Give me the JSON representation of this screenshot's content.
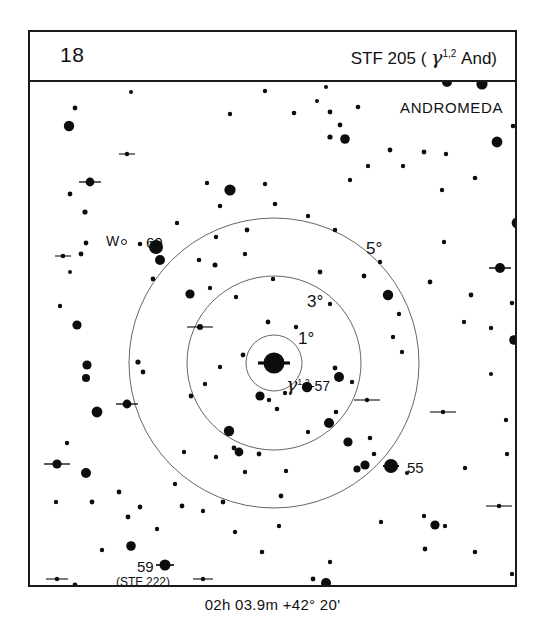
{
  "header": {
    "chart_number": "18",
    "title_prefix": "STF 205 ( ",
    "title_greek": "γ",
    "title_superscript": "1,2",
    "title_suffix": " And)"
  },
  "footer": {
    "coordinates": "02h 03.9m  +42° 20'"
  },
  "chart_data": {
    "type": "scatter",
    "title": "STF 205 ( γ1,2 And)",
    "chart_number": "18",
    "constellation": "ANDROMEDA",
    "center_coordinates": "02h 03.9m  +42° 20'",
    "direction_marker": "W",
    "field_center": {
      "x": 244,
      "y": 281
    },
    "rings": [
      {
        "label": "1°",
        "radius_px": 28,
        "degrees": 1
      },
      {
        "label": "3°",
        "radius_px": 87,
        "degrees": 3
      },
      {
        "label": "5°",
        "radius_px": 145,
        "degrees": 5
      }
    ],
    "star_labels": [
      {
        "text": "60",
        "star": "60 And"
      },
      {
        "text": "55",
        "star": "55 And"
      },
      {
        "text": "59",
        "star": "59 And"
      },
      {
        "text": "(STF 222)",
        "star": "59 And companion designation"
      },
      {
        "text": "γ1,2",
        "star": "gamma Andromedae (primary target)"
      },
      {
        "text": "-57",
        "star": "57 And"
      }
    ],
    "xlabel": "",
    "ylabel": "",
    "grid": false,
    "legend": "none",
    "stars": [
      {
        "x": 244,
        "y": 281,
        "r": 10.5,
        "tick": 16
      },
      {
        "x": 126,
        "y": 165,
        "r": 7.0,
        "tick": 0
      },
      {
        "x": 361,
        "y": 384,
        "r": 7.0,
        "tick": 8
      },
      {
        "x": 135,
        "y": 483,
        "r": 5.5,
        "tick": 9
      },
      {
        "x": 101,
        "y": 10,
        "r": 2.0,
        "tick": 0
      },
      {
        "x": 45,
        "y": 26,
        "r": 2.4,
        "tick": 0
      },
      {
        "x": 39,
        "y": 44,
        "r": 5.2,
        "tick": 0
      },
      {
        "x": 235,
        "y": 9,
        "r": 2.2,
        "tick": 0
      },
      {
        "x": 200,
        "y": 32,
        "r": 2.2,
        "tick": 0
      },
      {
        "x": 264,
        "y": 31,
        "r": 2.3,
        "tick": 0
      },
      {
        "x": 300,
        "y": 30,
        "r": 2.4,
        "tick": 0
      },
      {
        "x": 296,
        "y": 5,
        "r": 2.0,
        "tick": 0
      },
      {
        "x": 417,
        "y": 0,
        "r": 5.0,
        "tick": 0
      },
      {
        "x": 452,
        "y": 2,
        "r": 5.6,
        "tick": 0
      },
      {
        "x": 483,
        "y": 44,
        "r": 2.3,
        "tick": 0
      },
      {
        "x": 467,
        "y": 60,
        "r": 5.4,
        "tick": 0
      },
      {
        "x": 310,
        "y": 43,
        "r": 2.4,
        "tick": 0
      },
      {
        "x": 328,
        "y": 25,
        "r": 2.3,
        "tick": 0
      },
      {
        "x": 300,
        "y": 55,
        "r": 2.6,
        "tick": 0
      },
      {
        "x": 315,
        "y": 57,
        "r": 4.8,
        "tick": 0
      },
      {
        "x": 287,
        "y": 19,
        "r": 2.0,
        "tick": 0
      },
      {
        "x": 360,
        "y": 68,
        "r": 2.4,
        "tick": 0
      },
      {
        "x": 394,
        "y": 70,
        "r": 2.4,
        "tick": 0
      },
      {
        "x": 373,
        "y": 84,
        "r": 2.2,
        "tick": 0
      },
      {
        "x": 338,
        "y": 84,
        "r": 2.2,
        "tick": 0
      },
      {
        "x": 320,
        "y": 98,
        "r": 2.2,
        "tick": 0
      },
      {
        "x": 490,
        "y": 78,
        "r": 2.0,
        "tick": 0
      },
      {
        "x": 97,
        "y": 72,
        "r": 2.2,
        "tick": 8
      },
      {
        "x": 60,
        "y": 100,
        "r": 4.4,
        "tick": 11
      },
      {
        "x": 40,
        "y": 112,
        "r": 2.4,
        "tick": 0
      },
      {
        "x": 55,
        "y": 130,
        "r": 2.6,
        "tick": 0
      },
      {
        "x": 56,
        "y": 161,
        "r": 2.4,
        "tick": 0
      },
      {
        "x": 33,
        "y": 174,
        "r": 2.3,
        "tick": 8
      },
      {
        "x": 51,
        "y": 172,
        "r": 2.4,
        "tick": 0
      },
      {
        "x": 40,
        "y": 190,
        "r": 2.0,
        "tick": 0
      },
      {
        "x": 110,
        "y": 162,
        "r": 2.3,
        "tick": 0
      },
      {
        "x": 190,
        "y": 124,
        "r": 2.3,
        "tick": 0
      },
      {
        "x": 177,
        "y": 101,
        "r": 2.2,
        "tick": 0
      },
      {
        "x": 235,
        "y": 102,
        "r": 2.2,
        "tick": 0
      },
      {
        "x": 200,
        "y": 108,
        "r": 5.6,
        "tick": 0
      },
      {
        "x": 245,
        "y": 122,
        "r": 2.3,
        "tick": 0
      },
      {
        "x": 147,
        "y": 141,
        "r": 2.2,
        "tick": 0
      },
      {
        "x": 217,
        "y": 148,
        "r": 2.4,
        "tick": 0
      },
      {
        "x": 278,
        "y": 134,
        "r": 2.2,
        "tick": 0
      },
      {
        "x": 305,
        "y": 148,
        "r": 2.3,
        "tick": 0
      },
      {
        "x": 186,
        "y": 155,
        "r": 2.2,
        "tick": 0
      },
      {
        "x": 185,
        "y": 183,
        "r": 2.5,
        "tick": 0
      },
      {
        "x": 215,
        "y": 172,
        "r": 2.2,
        "tick": 0
      },
      {
        "x": 130,
        "y": 178,
        "r": 5.0,
        "tick": 0
      },
      {
        "x": 169,
        "y": 178,
        "r": 2.3,
        "tick": 0
      },
      {
        "x": 123,
        "y": 197,
        "r": 2.4,
        "tick": 0
      },
      {
        "x": 160,
        "y": 212,
        "r": 4.6,
        "tick": 0
      },
      {
        "x": 180,
        "y": 206,
        "r": 2.2,
        "tick": 0
      },
      {
        "x": 266,
        "y": 245,
        "r": 2.2,
        "tick": 0
      },
      {
        "x": 206,
        "y": 215,
        "r": 2.2,
        "tick": 0
      },
      {
        "x": 170,
        "y": 245,
        "r": 3.0,
        "tick": 13
      },
      {
        "x": 243,
        "y": 197,
        "r": 2.2,
        "tick": 0
      },
      {
        "x": 290,
        "y": 190,
        "r": 2.4,
        "tick": 0
      },
      {
        "x": 334,
        "y": 194,
        "r": 2.4,
        "tick": 0
      },
      {
        "x": 350,
        "y": 180,
        "r": 2.2,
        "tick": 0
      },
      {
        "x": 358,
        "y": 213,
        "r": 5.2,
        "tick": 0
      },
      {
        "x": 369,
        "y": 232,
        "r": 2.2,
        "tick": 0
      },
      {
        "x": 300,
        "y": 222,
        "r": 2.2,
        "tick": 0
      },
      {
        "x": 414,
        "y": 160,
        "r": 2.2,
        "tick": 0
      },
      {
        "x": 400,
        "y": 200,
        "r": 2.4,
        "tick": 0
      },
      {
        "x": 441,
        "y": 213,
        "r": 2.4,
        "tick": 0
      },
      {
        "x": 470,
        "y": 186,
        "r": 5.0,
        "tick": 11
      },
      {
        "x": 482,
        "y": 221,
        "r": 2.3,
        "tick": 0
      },
      {
        "x": 487,
        "y": 141,
        "r": 5.4,
        "tick": 0
      },
      {
        "x": 434,
        "y": 240,
        "r": 2.2,
        "tick": 0
      },
      {
        "x": 461,
        "y": 246,
        "r": 2.2,
        "tick": 0
      },
      {
        "x": 416,
        "y": 72,
        "r": 2.2,
        "tick": 0
      },
      {
        "x": 445,
        "y": 96,
        "r": 2.3,
        "tick": 0
      },
      {
        "x": 412,
        "y": 108,
        "r": 2.2,
        "tick": 0
      },
      {
        "x": 30,
        "y": 224,
        "r": 2.2,
        "tick": 0
      },
      {
        "x": 47,
        "y": 243,
        "r": 4.6,
        "tick": 0
      },
      {
        "x": 57,
        "y": 283,
        "r": 4.6,
        "tick": 0
      },
      {
        "x": 56,
        "y": 296,
        "r": 4.0,
        "tick": 0
      },
      {
        "x": 108,
        "y": 280,
        "r": 2.6,
        "tick": 0
      },
      {
        "x": 175,
        "y": 302,
        "r": 2.2,
        "tick": 0
      },
      {
        "x": 238,
        "y": 240,
        "r": 2.4,
        "tick": 0
      },
      {
        "x": 230,
        "y": 314,
        "r": 4.6,
        "tick": 0
      },
      {
        "x": 161,
        "y": 314,
        "r": 2.4,
        "tick": 0
      },
      {
        "x": 190,
        "y": 285,
        "r": 2.2,
        "tick": 0
      },
      {
        "x": 213,
        "y": 273,
        "r": 2.4,
        "tick": 0
      },
      {
        "x": 277,
        "y": 305,
        "r": 5.2,
        "tick": 0
      },
      {
        "x": 247,
        "y": 327,
        "r": 2.3,
        "tick": 0
      },
      {
        "x": 255,
        "y": 311,
        "r": 2.2,
        "tick": 0
      },
      {
        "x": 239,
        "y": 318,
        "r": 2.2,
        "tick": 0
      },
      {
        "x": 305,
        "y": 286,
        "r": 2.4,
        "tick": 0
      },
      {
        "x": 309,
        "y": 295,
        "r": 5.0,
        "tick": 0
      },
      {
        "x": 322,
        "y": 300,
        "r": 2.2,
        "tick": 0
      },
      {
        "x": 306,
        "y": 330,
        "r": 2.3,
        "tick": 0
      },
      {
        "x": 337,
        "y": 318,
        "r": 2.2,
        "tick": 13
      },
      {
        "x": 299,
        "y": 341,
        "r": 5.0,
        "tick": 0
      },
      {
        "x": 278,
        "y": 350,
        "r": 2.2,
        "tick": 0
      },
      {
        "x": 344,
        "y": 372,
        "r": 2.3,
        "tick": 0
      },
      {
        "x": 335,
        "y": 383,
        "r": 4.6,
        "tick": 0
      },
      {
        "x": 327,
        "y": 387,
        "r": 3.6,
        "tick": 0
      },
      {
        "x": 377,
        "y": 391,
        "r": 2.1,
        "tick": 0
      },
      {
        "x": 340,
        "y": 356,
        "r": 2.3,
        "tick": 0
      },
      {
        "x": 318,
        "y": 360,
        "r": 4.6,
        "tick": 0
      },
      {
        "x": 186,
        "y": 375,
        "r": 2.2,
        "tick": 0
      },
      {
        "x": 199,
        "y": 349,
        "r": 5.2,
        "tick": 0
      },
      {
        "x": 204,
        "y": 366,
        "r": 2.4,
        "tick": 0
      },
      {
        "x": 215,
        "y": 390,
        "r": 2.2,
        "tick": 0
      },
      {
        "x": 209,
        "y": 370,
        "r": 4.4,
        "tick": 0
      },
      {
        "x": 113,
        "y": 290,
        "r": 2.4,
        "tick": 0
      },
      {
        "x": 67,
        "y": 330,
        "r": 5.4,
        "tick": 0
      },
      {
        "x": 97,
        "y": 322,
        "r": 4.4,
        "tick": 11
      },
      {
        "x": 37,
        "y": 361,
        "r": 2.2,
        "tick": 0
      },
      {
        "x": 27,
        "y": 382,
        "r": 4.6,
        "tick": 13
      },
      {
        "x": 56,
        "y": 391,
        "r": 5.0,
        "tick": 0
      },
      {
        "x": 26,
        "y": 420,
        "r": 2.2,
        "tick": 0
      },
      {
        "x": 62,
        "y": 420,
        "r": 2.4,
        "tick": 0
      },
      {
        "x": 89,
        "y": 410,
        "r": 2.4,
        "tick": 0
      },
      {
        "x": 98,
        "y": 435,
        "r": 2.4,
        "tick": 0
      },
      {
        "x": 110,
        "y": 425,
        "r": 2.4,
        "tick": 0
      },
      {
        "x": 101,
        "y": 464,
        "r": 4.8,
        "tick": 0
      },
      {
        "x": 72,
        "y": 468,
        "r": 2.2,
        "tick": 0
      },
      {
        "x": 152,
        "y": 424,
        "r": 2.4,
        "tick": 0
      },
      {
        "x": 173,
        "y": 429,
        "r": 2.2,
        "tick": 0
      },
      {
        "x": 193,
        "y": 420,
        "r": 2.4,
        "tick": 0
      },
      {
        "x": 229,
        "y": 372,
        "r": 2.4,
        "tick": 0
      },
      {
        "x": 256,
        "y": 389,
        "r": 2.2,
        "tick": 0
      },
      {
        "x": 251,
        "y": 414,
        "r": 2.4,
        "tick": 0
      },
      {
        "x": 173,
        "y": 497,
        "r": 2.2,
        "tick": 10
      },
      {
        "x": 121,
        "y": 508,
        "r": 2.2,
        "tick": 0
      },
      {
        "x": 148,
        "y": 530,
        "r": 2.2,
        "tick": 0
      },
      {
        "x": 27,
        "y": 497,
        "r": 2.2,
        "tick": 11
      },
      {
        "x": 45,
        "y": 503,
        "r": 2.4,
        "tick": 0
      },
      {
        "x": 18,
        "y": 512,
        "r": 4.2,
        "tick": 0
      },
      {
        "x": 300,
        "y": 480,
        "r": 2.2,
        "tick": 0
      },
      {
        "x": 283,
        "y": 497,
        "r": 2.4,
        "tick": 0
      },
      {
        "x": 296,
        "y": 501,
        "r": 5.0,
        "tick": 0
      },
      {
        "x": 328,
        "y": 519,
        "r": 2.2,
        "tick": 0
      },
      {
        "x": 395,
        "y": 467,
        "r": 2.4,
        "tick": 0
      },
      {
        "x": 445,
        "y": 470,
        "r": 2.3,
        "tick": 0
      },
      {
        "x": 482,
        "y": 492,
        "r": 2.2,
        "tick": 0
      },
      {
        "x": 394,
        "y": 434,
        "r": 2.2,
        "tick": 0
      },
      {
        "x": 415,
        "y": 444,
        "r": 2.2,
        "tick": 0
      },
      {
        "x": 405,
        "y": 443,
        "r": 4.6,
        "tick": 0
      },
      {
        "x": 351,
        "y": 440,
        "r": 2.2,
        "tick": 0
      },
      {
        "x": 469,
        "y": 424,
        "r": 2.2,
        "tick": 13
      },
      {
        "x": 435,
        "y": 386,
        "r": 2.2,
        "tick": 0
      },
      {
        "x": 477,
        "y": 372,
        "r": 2.2,
        "tick": 0
      },
      {
        "x": 476,
        "y": 338,
        "r": 2.2,
        "tick": 0
      },
      {
        "x": 413,
        "y": 330,
        "r": 2.2,
        "tick": 13
      },
      {
        "x": 461,
        "y": 292,
        "r": 2.1,
        "tick": 0
      },
      {
        "x": 484,
        "y": 258,
        "r": 4.8,
        "tick": 0
      },
      {
        "x": 372,
        "y": 270,
        "r": 2.2,
        "tick": 0
      },
      {
        "x": 363,
        "y": 255,
        "r": 2.2,
        "tick": 0
      },
      {
        "x": 418,
        "y": 518,
        "r": 2.2,
        "tick": 0
      },
      {
        "x": 232,
        "y": 470,
        "r": 2.3,
        "tick": 0
      },
      {
        "x": 205,
        "y": 450,
        "r": 2.2,
        "tick": 0
      },
      {
        "x": 249,
        "y": 444,
        "r": 2.2,
        "tick": 0
      },
      {
        "x": 127,
        "y": 447,
        "r": 2.2,
        "tick": 0
      },
      {
        "x": 145,
        "y": 402,
        "r": 2.2,
        "tick": 0
      },
      {
        "x": 154,
        "y": 370,
        "r": 2.2,
        "tick": 0
      }
    ]
  },
  "labels": {
    "constellation": "ANDROMEDA",
    "ring_5": "5°",
    "ring_3": "3°",
    "ring_1": "1°",
    "west": "W",
    "star_60": "60",
    "star_55": "55",
    "star_59": "59",
    "star_59_alt": "(STF 222)",
    "gamma_greek": "γ",
    "gamma_sup": "1,2",
    "gamma_suffix": "-57"
  }
}
